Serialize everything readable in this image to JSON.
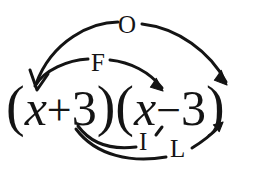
{
  "diagram": {
    "method": "FOIL",
    "background_color": "#ffffff",
    "ink_color": "#141414"
  },
  "expression": {
    "full": "(x + 3)(x - 3)",
    "left_paren_1": "(",
    "term_1_var": "x",
    "operator_1": "+",
    "term_1_const": "3",
    "right_paren_1": ")",
    "left_paren_2": "(",
    "term_2_var": "x",
    "operator_2": "−",
    "term_2_const": "3",
    "right_paren_2": ")"
  },
  "labels": {
    "first": "F",
    "outer": "O",
    "inner": "I",
    "last": "L"
  },
  "arcs": [
    {
      "id": "first",
      "label": "F",
      "from": "x (first binomial)",
      "to": "x (second binomial)",
      "position": "above",
      "has_arrowheads": true
    },
    {
      "id": "outer",
      "label": "O",
      "from": "x (first binomial)",
      "to": "3 (second binomial)",
      "position": "above",
      "has_arrowheads": true
    },
    {
      "id": "inner",
      "label": "I",
      "from": "3 (first binomial)",
      "to": "x (second binomial)",
      "position": "below",
      "has_arrowheads": true
    },
    {
      "id": "last",
      "label": "L",
      "from": "3 (first binomial)",
      "to": "3 (second binomial)",
      "position": "below",
      "has_arrowheads": true
    }
  ]
}
